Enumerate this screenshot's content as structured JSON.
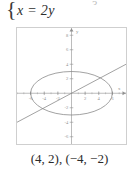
{
  "equation": {
    "brace": "{",
    "text": "x = 2y",
    "clipped_above": "3"
  },
  "caption": {
    "text": "(4, 2), (−4, −2)"
  },
  "chart_data": {
    "type": "line",
    "title": "",
    "xlabel": "x",
    "ylabel": "y",
    "xlim": [
      -8,
      8
    ],
    "ylim": [
      -7,
      9
    ],
    "grid": false,
    "legend": "none",
    "axis_color": "#8f8f8f",
    "curve_color": "#7a7a7a",
    "frame_color": "#cfcfcf",
    "x_ticks": [
      -6,
      -4,
      -2,
      2,
      4,
      6
    ],
    "x_tick_labels": [
      "-6",
      "-4",
      "-2",
      "2",
      "4",
      "6"
    ],
    "y_ticks": [
      -6,
      -4,
      -2,
      2,
      4,
      6,
      8
    ],
    "y_tick_labels": [
      "-6",
      "-4",
      "-2",
      "2",
      "4",
      "6",
      "8"
    ],
    "x_axis_tip_label": "x",
    "y_axis_tip_label": "y",
    "series": [
      {
        "name": "ellipse",
        "type": "ellipse",
        "center": [
          0,
          0
        ],
        "semi_axis_x": 6,
        "semi_axis_y": 3
      },
      {
        "name": "line",
        "type": "line",
        "equation": "x = 2y",
        "slope": 0.5,
        "intercept": 0,
        "x_from": -8,
        "x_to": 8
      }
    ],
    "intersections": [
      [
        4,
        2
      ],
      [
        -4,
        -2
      ]
    ]
  }
}
